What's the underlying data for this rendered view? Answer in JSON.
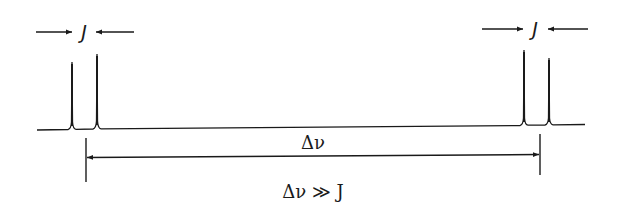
{
  "diagram": {
    "left_coupling_label": "J",
    "right_coupling_label": "J",
    "shift_label": "Δν",
    "condition_label": "Δν ≫ J",
    "line_color": "#1a1a1a",
    "background": "#ffffff",
    "peaks": [
      {
        "x": 72,
        "top": 62
      },
      {
        "x": 97,
        "top": 54
      },
      {
        "x": 524,
        "top": 50
      },
      {
        "x": 549,
        "top": 58
      }
    ]
  }
}
